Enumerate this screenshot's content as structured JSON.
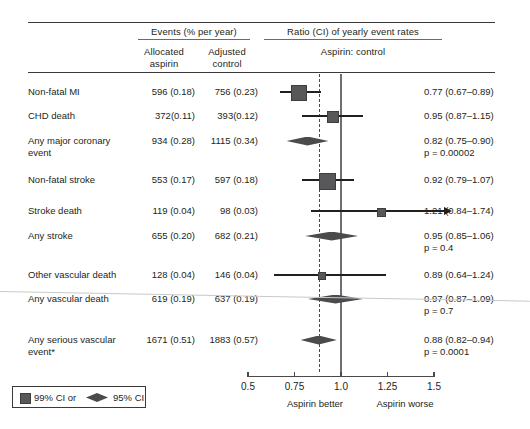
{
  "header": {
    "group_events": "Events (% per year)",
    "group_ratio": "Ratio (CI) of yearly event rates",
    "col_allocated_1": "Allocated",
    "col_allocated_2": "aspirin",
    "col_adjusted_1": "Adjusted",
    "col_adjusted_2": "control",
    "ratio_sub": "Aspirin: control"
  },
  "rows": [
    {
      "label": "Non-fatal MI",
      "label2": "",
      "allocated": "596 (0.18)",
      "adjusted": "756 (0.23)",
      "ratio": "0.77 (0.67–0.89)",
      "p": "",
      "marker": "square",
      "estimate": 0.77,
      "ci_low": 0.67,
      "ci_high": 0.89,
      "size": 14
    },
    {
      "label": "CHD death",
      "label2": "",
      "allocated": "372(0.11)",
      "adjusted": "393(0.12)",
      "ratio": "0.95 (0.87–1.15)",
      "p": "",
      "marker": "square",
      "estimate": 0.95,
      "ci_low": 0.79,
      "ci_high": 1.12,
      "size": 10
    },
    {
      "label": "Any major coronary",
      "label2": "event",
      "allocated": "934 (0.28)",
      "adjusted": "1115 (0.34)",
      "ratio": "0.82 (0.75–0.90)",
      "p": "p = 0.00002",
      "marker": "diamond",
      "estimate": 0.82,
      "ci_low": 0.75,
      "ci_high": 0.9,
      "size": 9
    },
    {
      "label": "Non-fatal stroke",
      "label2": "",
      "allocated": "553 (0.17)",
      "adjusted": "597 (0.18)",
      "ratio": "0.92 (0.79–1.07)",
      "p": "",
      "marker": "square",
      "estimate": 0.92,
      "ci_low": 0.79,
      "ci_high": 1.07,
      "size": 15
    },
    {
      "label": "Stroke death",
      "label2": "",
      "allocated": "119 (0.04)",
      "adjusted": "98 (0.03)",
      "ratio": "1.21 (0.84–1.74)",
      "p": "",
      "marker": "square",
      "estimate": 1.21,
      "ci_low": 0.84,
      "ci_high": 1.74,
      "size": 7
    },
    {
      "label": "Any stroke",
      "label2": "",
      "allocated": "655 (0.20)",
      "adjusted": "682 (0.21)",
      "ratio": "0.95 (0.85–1.06)",
      "p": "p = 0.4",
      "marker": "diamond",
      "estimate": 0.95,
      "ci_low": 0.85,
      "ci_high": 1.06,
      "size": 9
    },
    {
      "label": "Other vascular death",
      "label2": "",
      "allocated": "128 (0.04)",
      "adjusted": "146 (0.04)",
      "ratio": "0.89 (0.64–1.24)",
      "p": "",
      "marker": "square",
      "estimate": 0.89,
      "ci_low": 0.64,
      "ci_high": 1.24,
      "size": 6
    },
    {
      "label": "Any vascular death",
      "label2": "",
      "allocated": "619 (0.19)",
      "adjusted": "637 (0.19)",
      "ratio": "0.97 (0.87–1.09)",
      "p": "p = 0.7",
      "marker": "diamond",
      "estimate": 0.97,
      "ci_low": 0.87,
      "ci_high": 1.09,
      "size": 9
    },
    {
      "label": "Any serious vascular",
      "label2": "event*",
      "allocated": "1671 (0.51)",
      "adjusted": "1883 (0.57)",
      "ratio": "0.88 (0.82–0.94)",
      "p": "p = 0.0001",
      "marker": "diamond",
      "estimate": 0.88,
      "ci_low": 0.82,
      "ci_high": 0.94,
      "size": 9
    }
  ],
  "axis": {
    "ticks": [
      "0.5",
      "0.75",
      "1.0",
      "1.25",
      "1.5"
    ],
    "tick_values": [
      0.5,
      0.75,
      1.0,
      1.25,
      1.5
    ],
    "min": 0.5,
    "max": 1.5,
    "null_value": 1.0,
    "summary_value": 0.88,
    "caption_left": "Aspirin better",
    "caption_right": "Aspirin worse"
  },
  "legend": {
    "item_99": "99% CI or",
    "item_95": "95% CI"
  },
  "chart_data": {
    "type": "forest",
    "xlabel": "Rate ratio",
    "xlim": [
      0.5,
      1.5
    ],
    "xticks": [
      0.5,
      0.75,
      1.0,
      1.25,
      1.5
    ],
    "grid": false,
    "null_line": 1.0,
    "summary_line": 0.88,
    "categories": [
      "Non-fatal MI",
      "CHD death",
      "Any major coronary event",
      "Non-fatal stroke",
      "Stroke death",
      "Any stroke",
      "Other vascular death",
      "Any vascular death",
      "Any serious vascular event*"
    ],
    "estimates": [
      0.77,
      0.95,
      0.82,
      0.92,
      1.21,
      0.95,
      0.89,
      0.97,
      0.88
    ],
    "ci_low": [
      0.67,
      0.79,
      0.75,
      0.79,
      0.84,
      0.85,
      0.64,
      0.87,
      0.82
    ],
    "ci_high": [
      0.89,
      1.12,
      0.9,
      1.07,
      1.74,
      1.06,
      1.24,
      1.09,
      0.94
    ],
    "marker_types": [
      "square",
      "square",
      "diamond",
      "square",
      "square",
      "diamond",
      "square",
      "diamond",
      "diamond"
    ],
    "events_aspirin": [
      "596 (0.18)",
      "372(0.11)",
      "934 (0.28)",
      "553 (0.17)",
      "119 (0.04)",
      "655 (0.20)",
      "128 (0.04)",
      "619 (0.19)",
      "1671 (0.51)"
    ],
    "events_control": [
      "756 (0.23)",
      "393(0.12)",
      "1115 (0.34)",
      "597 (0.18)",
      "98 (0.03)",
      "682 (0.21)",
      "146 (0.04)",
      "637 (0.19)",
      "1883 (0.57)"
    ],
    "ratio_labels": [
      "0.77 (0.67–0.89)",
      "0.95 (0.87–1.15)",
      "0.82 (0.75–0.90)",
      "0.92 (0.79–1.07)",
      "1.21 (0.84–1.74)",
      "0.95 (0.85–1.06)",
      "0.89 (0.64–1.24)",
      "0.97 (0.87–1.09)",
      "0.88 (0.82–0.94)"
    ],
    "p_values": [
      "",
      "",
      "p = 0.00002",
      "",
      "",
      "p = 0.4",
      "",
      "p = 0.7",
      "p = 0.0001"
    ],
    "legend": [
      "99% CI or",
      "95% CI"
    ],
    "legend_position": "bottom-left"
  }
}
